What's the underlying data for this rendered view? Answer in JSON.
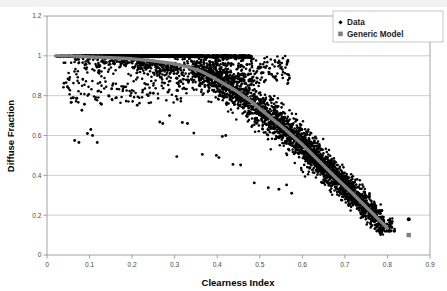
{
  "chart_data": {
    "type": "scatter",
    "title": "",
    "xlabel": "Clearness Index",
    "ylabel": "Diffuse Fraction",
    "xlim": [
      0,
      0.9
    ],
    "ylim": [
      0,
      1.2
    ],
    "xticks": [
      "0",
      "0.1",
      "0.2",
      "0.3",
      "0.4",
      "0.5",
      "0.6",
      "0.7",
      "0.8",
      "0.9"
    ],
    "xtick_values": [
      0,
      0.1,
      0.2,
      0.3,
      0.4,
      0.5,
      0.6,
      0.7,
      0.8,
      0.9
    ],
    "yticks": [
      "0",
      "0.2",
      "0.4",
      "0.6",
      "0.8",
      "1",
      "1.2"
    ],
    "ytick_values": [
      0,
      0.2,
      0.4,
      0.6,
      0.8,
      1.0,
      1.2
    ],
    "grid": "horizontal",
    "legend_position": "top-right",
    "series": [
      {
        "name": "Data",
        "type": "scatter",
        "marker": "diamond",
        "color": "#000000",
        "description": "Dense cloud of measured diffuse fraction vs clearness index; saturated at 1.0 for clearness below 0.35, falling to ~0.15 near clearness 0.8",
        "n_points": 2400
      },
      {
        "name": "Generic Model",
        "type": "line",
        "marker": "square",
        "color": "#808080",
        "description": "Smooth gray model curve; flat near 1.0 up to clearness 0.2, knee near 0.35, decreasing to ~0.13 at clearness 0.80",
        "curve_points": [
          [
            0.02,
            1.0
          ],
          [
            0.05,
            1.0
          ],
          [
            0.1,
            0.995
          ],
          [
            0.15,
            0.99
          ],
          [
            0.2,
            0.985
          ],
          [
            0.25,
            0.975
          ],
          [
            0.3,
            0.96
          ],
          [
            0.33,
            0.945
          ],
          [
            0.36,
            0.925
          ],
          [
            0.4,
            0.88
          ],
          [
            0.44,
            0.83
          ],
          [
            0.48,
            0.77
          ],
          [
            0.52,
            0.7
          ],
          [
            0.56,
            0.63
          ],
          [
            0.6,
            0.555
          ],
          [
            0.64,
            0.47
          ],
          [
            0.68,
            0.385
          ],
          [
            0.72,
            0.305
          ],
          [
            0.76,
            0.22
          ],
          [
            0.8,
            0.135
          ]
        ]
      }
    ],
    "outliers": [
      {
        "x": 0.85,
        "y": 0.18,
        "series": "Data"
      },
      {
        "x": 0.85,
        "y": 0.1,
        "series": "Generic Model"
      }
    ]
  },
  "legend": {
    "entries": [
      {
        "label": "Data",
        "marker": "diamond-marker",
        "color": "#000000"
      },
      {
        "label": "Generic Model",
        "marker": "square-marker",
        "color": "#808080"
      }
    ]
  },
  "axes": {
    "x_title": "Clearness Index",
    "y_title": "Diffuse Fraction"
  }
}
